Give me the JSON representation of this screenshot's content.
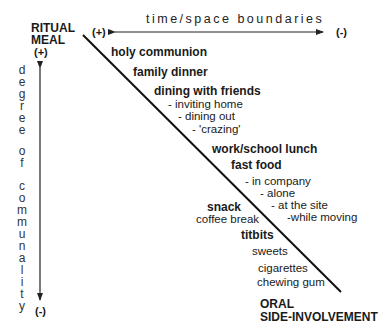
{
  "diagram": {
    "top_left_label": [
      "RITUAL",
      "MEAL"
    ],
    "bottom_right_label": [
      "ORAL",
      "SIDE-INVOLVEMENT"
    ],
    "horizontal_axis": {
      "label": "time/space boundaries",
      "left_end": "(+)",
      "right_end": "(-)"
    },
    "vertical_axis": {
      "label": "degree of communality",
      "letters": [
        "d",
        "e",
        "g",
        "r",
        "e",
        "e",
        "",
        "o",
        "f",
        "",
        "c",
        "o",
        "m",
        "m",
        "u",
        "n",
        "a",
        "l",
        "i",
        "t",
        "y"
      ],
      "top_end": "(+)",
      "bottom_end": "(-)"
    },
    "items": [
      {
        "text": "holy communion",
        "bold": true
      },
      {
        "text": "family dinner",
        "bold": true
      },
      {
        "text": "dining with friends",
        "bold": true
      },
      {
        "text": "-  inviting home",
        "bold": false
      },
      {
        "text": "- dining out",
        "bold": false
      },
      {
        "text": "-  'crazing'",
        "bold": false
      },
      {
        "text": "work/school lunch",
        "bold": true
      },
      {
        "text": "fast food",
        "bold": true
      },
      {
        "text": "- in company",
        "bold": false
      },
      {
        "text": "- alone",
        "bold": false
      },
      {
        "text": "- at the site",
        "bold": false
      },
      {
        "text": "-while moving",
        "bold": false
      },
      {
        "text": "snack",
        "bold": true
      },
      {
        "text": "coffee break",
        "bold": false
      },
      {
        "text": "titbits",
        "bold": true
      },
      {
        "text": "sweets",
        "bold": false
      },
      {
        "text": "cigarettes",
        "bold": false
      },
      {
        "text": "chewing gum",
        "bold": false
      }
    ]
  }
}
